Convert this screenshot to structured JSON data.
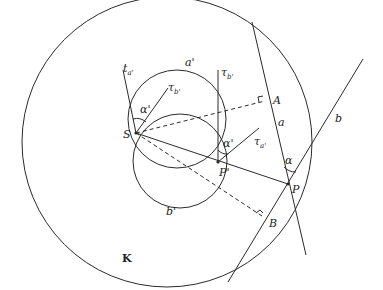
{
  "diagram": {
    "colors": {
      "stroke": "#2a2a2a",
      "background": "#ffffff"
    },
    "labels": {
      "K": "K",
      "S": "S",
      "A": "A",
      "B": "B",
      "P": "P",
      "P_prime": "P'",
      "a": "a",
      "b": "b",
      "a_prime": "a'",
      "b_prime": "b'",
      "alpha": "α",
      "alpha_prime_S": "α'",
      "alpha_prime_P": "α'",
      "t_a": "t",
      "t_a_sub": "a'",
      "tau_b_S": "τ",
      "tau_b_S_sub": "b'",
      "tau_b_P": "τ",
      "tau_b_P_sub": "b'",
      "tau_a_P": "τ",
      "tau_a_P_sub": "a'"
    }
  }
}
